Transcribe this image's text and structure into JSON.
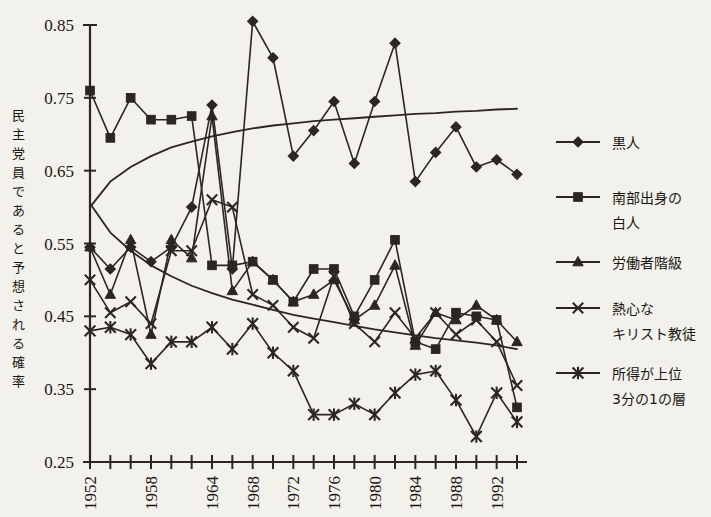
{
  "chart_data": {
    "type": "line",
    "title": "",
    "xlabel": "",
    "ylabel": "民主党員であると予想される確率",
    "xlim": [
      1952,
      1994
    ],
    "ylim": [
      0.25,
      0.85
    ],
    "ytick_labels": [
      "0.85",
      "0.75",
      "0.65",
      "0.55",
      "0.45",
      "0.35",
      "0.25"
    ],
    "ytick_values": [
      0.85,
      0.75,
      0.65,
      0.55,
      0.45,
      0.35,
      0.25
    ],
    "xtick_values": [
      1952,
      1954,
      1956,
      1958,
      1960,
      1962,
      1964,
      1966,
      1968,
      1970,
      1972,
      1974,
      1976,
      1978,
      1980,
      1982,
      1984,
      1986,
      1988,
      1990,
      1992,
      1994
    ],
    "xtick_labels_shown": [
      "1952",
      "1958",
      "1964",
      "1968",
      "1972",
      "1976",
      "1980",
      "1984",
      "1988",
      "1992"
    ],
    "xtick_labels_values": [
      1952,
      1958,
      1964,
      1968,
      1972,
      1976,
      1980,
      1984,
      1988,
      1992
    ],
    "grid": false,
    "legend_position": "right",
    "x": [
      1952,
      1954,
      1956,
      1958,
      1960,
      1962,
      1964,
      1966,
      1968,
      1970,
      1972,
      1974,
      1976,
      1978,
      1980,
      1982,
      1984,
      1986,
      1988,
      1990,
      1992,
      1994
    ],
    "series": [
      {
        "name": "黒人",
        "marker": "diamond",
        "values": [
          0.545,
          0.515,
          0.545,
          0.525,
          0.545,
          0.6,
          0.74,
          0.515,
          0.855,
          0.805,
          0.67,
          0.705,
          0.745,
          0.66,
          0.745,
          0.825,
          0.635,
          0.675,
          0.71,
          0.655,
          0.665,
          0.645
        ]
      },
      {
        "name": "南部出身の白人",
        "marker": "square",
        "values": [
          0.76,
          0.695,
          0.75,
          0.72,
          0.72,
          0.725,
          0.52,
          0.52,
          0.525,
          0.5,
          0.47,
          0.515,
          0.515,
          0.45,
          0.5,
          0.555,
          0.415,
          0.405,
          0.455,
          0.45,
          0.445,
          0.325
        ]
      },
      {
        "name": "労働者階級",
        "marker": "triangle",
        "values": [
          0.545,
          0.48,
          0.555,
          0.425,
          0.555,
          0.53,
          0.725,
          0.485,
          0.525,
          0.5,
          0.47,
          0.48,
          0.5,
          0.445,
          0.465,
          0.52,
          0.41,
          0.455,
          0.445,
          0.465,
          0.445,
          0.415
        ]
      },
      {
        "name": "熱心なキリスト教徒",
        "marker": "x",
        "values": [
          0.5,
          0.455,
          0.47,
          0.44,
          0.54,
          0.54,
          0.61,
          0.6,
          0.48,
          0.465,
          0.435,
          0.42,
          0.505,
          0.44,
          0.415,
          0.455,
          0.42,
          0.455,
          0.425,
          0.445,
          0.415,
          0.355
        ]
      },
      {
        "name": "所得が上位3分の1の層",
        "marker": "asterisk",
        "values": [
          0.43,
          0.435,
          0.425,
          0.385,
          0.415,
          0.415,
          0.435,
          0.405,
          0.44,
          0.4,
          0.375,
          0.315,
          0.315,
          0.33,
          0.315,
          0.345,
          0.37,
          0.375,
          0.335,
          0.285,
          0.345,
          0.305
        ]
      }
    ],
    "trend_curves": [
      {
        "name": "rising-trend",
        "points": [
          [
            1952,
            0.6
          ],
          [
            1954,
            0.635
          ],
          [
            1956,
            0.655
          ],
          [
            1958,
            0.67
          ],
          [
            1960,
            0.682
          ],
          [
            1962,
            0.69
          ],
          [
            1964,
            0.697
          ],
          [
            1966,
            0.703
          ],
          [
            1968,
            0.708
          ],
          [
            1970,
            0.712
          ],
          [
            1972,
            0.715
          ],
          [
            1974,
            0.718
          ],
          [
            1976,
            0.72
          ],
          [
            1978,
            0.722
          ],
          [
            1980,
            0.724
          ],
          [
            1982,
            0.726
          ],
          [
            1984,
            0.728
          ],
          [
            1986,
            0.729
          ],
          [
            1988,
            0.731
          ],
          [
            1990,
            0.732
          ],
          [
            1992,
            0.734
          ],
          [
            1994,
            0.735
          ]
        ]
      },
      {
        "name": "falling-trend",
        "points": [
          [
            1952,
            0.605
          ],
          [
            1954,
            0.565
          ],
          [
            1956,
            0.54
          ],
          [
            1958,
            0.52
          ],
          [
            1960,
            0.505
          ],
          [
            1962,
            0.492
          ],
          [
            1964,
            0.482
          ],
          [
            1966,
            0.473
          ],
          [
            1968,
            0.466
          ],
          [
            1970,
            0.459
          ],
          [
            1972,
            0.452
          ],
          [
            1974,
            0.447
          ],
          [
            1976,
            0.442
          ],
          [
            1978,
            0.437
          ],
          [
            1980,
            0.432
          ],
          [
            1982,
            0.428
          ],
          [
            1984,
            0.424
          ],
          [
            1986,
            0.42
          ],
          [
            1988,
            0.417
          ],
          [
            1990,
            0.414
          ],
          [
            1992,
            0.41
          ],
          [
            1994,
            0.405
          ]
        ]
      }
    ]
  },
  "legend": {
    "items": [
      {
        "label": "黒人",
        "marker": "diamond",
        "lines": [
          "黒人"
        ]
      },
      {
        "label": "南部出身の白人",
        "marker": "square",
        "lines": [
          "南部出身の",
          "白人"
        ]
      },
      {
        "label": "労働者階級",
        "marker": "triangle",
        "lines": [
          "労働者階級"
        ]
      },
      {
        "label": "熱心なキリスト教徒",
        "marker": "x",
        "lines": [
          "熱心な",
          "キリスト教徒"
        ]
      },
      {
        "label": "所得が上位3分の1の層",
        "marker": "asterisk",
        "lines": [
          "所得が上位",
          "3分の1の層"
        ]
      }
    ]
  },
  "axis": {
    "y_title": "民主党員であると予想される確率",
    "y_title_chars": [
      "民",
      "主",
      "党",
      "員",
      "で",
      "あ",
      "る",
      "と",
      "予",
      "想",
      "さ",
      "れ",
      "る",
      "確",
      "率"
    ]
  },
  "colors": {
    "ink": "#2b2620",
    "background": "#f3f1ec"
  }
}
